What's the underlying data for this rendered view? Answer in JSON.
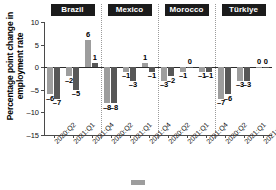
{
  "chart_data": {
    "type": "bar",
    "title": "",
    "subtitle": "",
    "xlabel": "",
    "ylabel": "Percentage point change in employment rate",
    "ylim": [
      -15,
      10
    ],
    "yticks": [
      10,
      5,
      0,
      -5,
      -10,
      -15
    ],
    "ytick_labels": [
      "10",
      "5",
      "0",
      "–5",
      "–10",
      "–15"
    ],
    "grid": false,
    "zero_reference_line": true,
    "panel_dividers": true,
    "legend_position": "bottom",
    "categories": [
      "2020:Q2",
      "2021:Q1",
      "2021:Q4"
    ],
    "panels": [
      {
        "name": "Brazil",
        "categories": [
          "2020:Q2",
          "2021:Q1",
          "2021:Q4"
        ],
        "series": [
          {
            "name": "series-1",
            "color": "#9d9d9d",
            "values": [
              -6,
              -2,
              6
            ],
            "labels": [
              "–6",
              "–2",
              "6"
            ]
          },
          {
            "name": "series-2",
            "color": "#575757",
            "values": [
              -7,
              -5,
              1
            ],
            "labels": [
              "–7",
              "–5",
              "1"
            ]
          }
        ]
      },
      {
        "name": "Mexico",
        "categories": [
          "2020:Q2",
          "2021:Q1",
          "2021:Q4"
        ],
        "series": [
          {
            "name": "series-1",
            "color": "#9d9d9d",
            "values": [
              -8,
              -1,
              1
            ],
            "labels": [
              "–8",
              "–1",
              "1"
            ]
          },
          {
            "name": "series-2",
            "color": "#575757",
            "values": [
              -8,
              -3,
              -1
            ],
            "labels": [
              "–8",
              "–3",
              "–1"
            ]
          }
        ]
      },
      {
        "name": "Morocco",
        "categories": [
          "2020:Q2",
          "2021:Q1",
          "2021:Q4"
        ],
        "series": [
          {
            "name": "series-1",
            "color": "#9d9d9d",
            "values": [
              -3,
              -1,
              -1
            ],
            "labels": [
              "–3",
              "–1",
              "–1"
            ]
          },
          {
            "name": "series-2",
            "color": "#575757",
            "values": [
              -2,
              0,
              -1
            ],
            "labels": [
              "–2",
              "0",
              "–1"
            ]
          }
        ]
      },
      {
        "name": "Türkiye",
        "categories": [
          "2020:Q2",
          "2021:Q1",
          "2021:Q4"
        ],
        "series": [
          {
            "name": "series-1",
            "color": "#9d9d9d",
            "values": [
              -7,
              -3,
              0
            ],
            "labels": [
              "–7",
              "–3",
              "0"
            ]
          },
          {
            "name": "series-2",
            "color": "#575757",
            "values": [
              -6,
              -3,
              0
            ],
            "labels": [
              "–6",
              "–3",
              "0"
            ]
          }
        ]
      }
    ]
  },
  "colors": {
    "series_1": "#9d9d9d",
    "series_2": "#575757",
    "panel_header_bg": "#1b1b1b",
    "panel_header_text": "#ffffff",
    "axis": "#4a4a4a",
    "background": "#ffffff"
  },
  "axis": {
    "y_title": "Percentage point change in employment rate"
  }
}
